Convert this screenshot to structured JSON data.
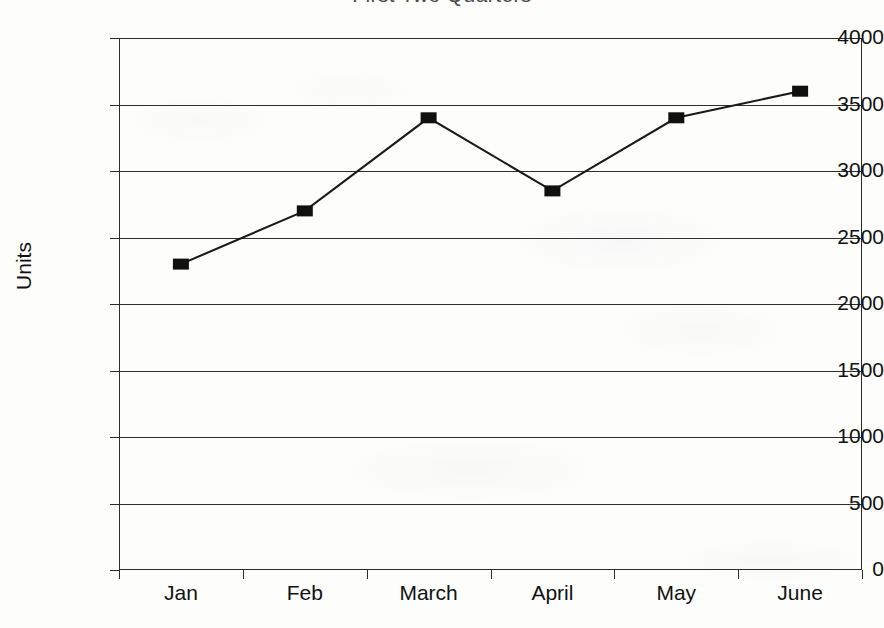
{
  "chart_data": {
    "type": "line",
    "title": "First Two Quarters",
    "xlabel": "",
    "ylabel": "Units",
    "categories": [
      "Jan",
      "Feb",
      "March",
      "April",
      "May",
      "June"
    ],
    "values": [
      2300,
      2700,
      3400,
      2850,
      3400,
      3600
    ],
    "series": [
      {
        "name": "Units",
        "values": [
          2300,
          2700,
          3400,
          2850,
          3400,
          3600
        ]
      }
    ],
    "ylim": [
      0,
      4000
    ],
    "yticks": [
      0,
      500,
      1000,
      1500,
      2000,
      2500,
      3000,
      3500,
      4000
    ],
    "ytick_labels": [
      "0",
      "500",
      "1000",
      "1500",
      "2000",
      "2500",
      "3000",
      "3500",
      "4000"
    ],
    "grid": true,
    "grid_axis": "y",
    "legend": false,
    "legend_position": "none",
    "marker": "filled-square",
    "line_color": "#1a1a1a",
    "marker_color": "#101010",
    "grid_color": "#2e2e2e",
    "background_color": "#fdfdfc",
    "title_color": "#4a4a4a",
    "title_cropped": true
  },
  "axes": {
    "y_title": "Units",
    "y_tick_labels": [
      "4000",
      "3500",
      "3000",
      "2500",
      "2000",
      "1500",
      "1000",
      "500",
      "0"
    ],
    "x_tick_labels": [
      "Jan",
      "Feb",
      "March",
      "April",
      "May",
      "June"
    ]
  }
}
